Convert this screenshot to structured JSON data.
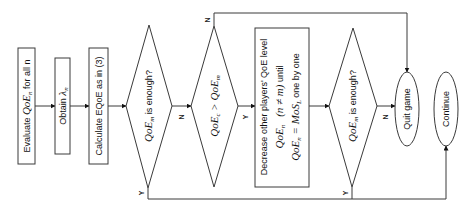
{
  "diagram": {
    "type": "flowchart",
    "orientation": "rotated-90-ccw",
    "nodes": {
      "evaluate": {
        "prefix": "Evaluate ",
        "math": "QoE",
        "sub": "n",
        "suffix": " for all n"
      },
      "obtain": {
        "prefix": "Obtain ",
        "math": "λ",
        "sub": "n"
      },
      "calculate": {
        "label": "Calculate EQoE as in (3)"
      },
      "decision1": {
        "math": "QoE",
        "sub": "m",
        "suffix": " is enough?"
      },
      "decision2": {
        "math_a": "QoE",
        "sub_a": "c",
        "op": " > ",
        "math_b": "QoE",
        "sub_b": "m"
      },
      "decrease": {
        "line1": "Decrease other players' QoE level",
        "line2_math": "QoE",
        "line2_sub": "n",
        "line2_cond": "(n ≠ m)",
        "line2_suffix": " until",
        "line3_math": "QoE",
        "line3_sub": "n",
        "line3_eq": " = MoS",
        "line3_sub2": "L",
        "line3_suffix": " one by one"
      },
      "decision3": {
        "math": "QoE",
        "sub": "m",
        "suffix": " is enough?"
      },
      "quit": {
        "label": "Quit game"
      },
      "continue": {
        "label": "Continue"
      }
    },
    "edge_labels": {
      "d1_no": "N",
      "d1_yes": "Y",
      "d2_no": "N",
      "d2_yes": "Y",
      "d3_no": "N",
      "d3_yes": "Y"
    }
  }
}
